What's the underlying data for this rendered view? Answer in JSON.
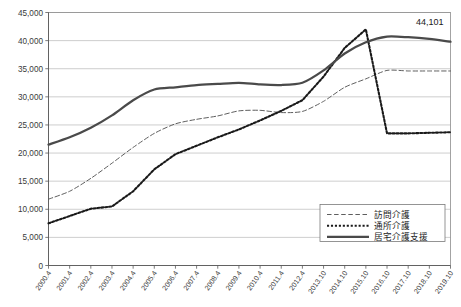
{
  "chart_data": {
    "type": "line",
    "title": "",
    "subtitle": "",
    "xlabel": "",
    "ylabel": "",
    "ylim": [
      0,
      45000
    ],
    "ytick_step": 5000,
    "grid": true,
    "legend_position": "bottom-right",
    "yticks": [
      "0",
      "5,000",
      "10,000",
      "15,000",
      "20,000",
      "25,000",
      "30,000",
      "35,000",
      "40,000",
      "45,000"
    ],
    "ytick_values": [
      0,
      5000,
      10000,
      15000,
      20000,
      25000,
      30000,
      35000,
      40000,
      45000
    ],
    "categories": [
      "2000.4",
      "2001.4",
      "2002.4",
      "2003.4",
      "2004.4",
      "2005.4",
      "2006.4",
      "2007.4",
      "2008.4",
      "2009.4",
      "2010.4",
      "2011.4",
      "2012.4",
      "2013.10",
      "2014.10",
      "2015.10",
      "2016.10",
      "2017.10",
      "2018.10",
      "2019.10"
    ],
    "series": [
      {
        "name": "訪問介護",
        "style": "dashed",
        "color": "#555555",
        "values": [
          11800,
          13200,
          15500,
          18200,
          21000,
          23500,
          25200,
          26000,
          26600,
          27500,
          27600,
          27200,
          27400,
          29200,
          31700,
          33200,
          34700,
          34600,
          34600,
          34600
        ]
      },
      {
        "name": "通所介護",
        "style": "dotted",
        "color": "#1a1a1a",
        "values": [
          7500,
          8800,
          10100,
          10500,
          13200,
          17100,
          19800,
          21300,
          22800,
          24200,
          25800,
          27500,
          29400,
          33600,
          38700,
          42000,
          23500,
          23500,
          23600,
          23700
        ]
      },
      {
        "name": "居宅介護支援",
        "style": "solid",
        "color": "#4a4a4a",
        "values": [
          21500,
          22800,
          24500,
          26700,
          29400,
          31300,
          31700,
          32100,
          32300,
          32500,
          32200,
          32100,
          32500,
          34700,
          37700,
          39700,
          40700,
          40600,
          40300,
          39800
        ]
      }
    ],
    "annotations": [
      {
        "text": "44,101",
        "x_index": 19,
        "value": 44101
      }
    ]
  },
  "legend": {
    "items": [
      {
        "label": "訪問介護",
        "style": "dashed"
      },
      {
        "label": "通所介護",
        "style": "dotted"
      },
      {
        "label": "居宅介護支援",
        "style": "solid"
      }
    ]
  }
}
